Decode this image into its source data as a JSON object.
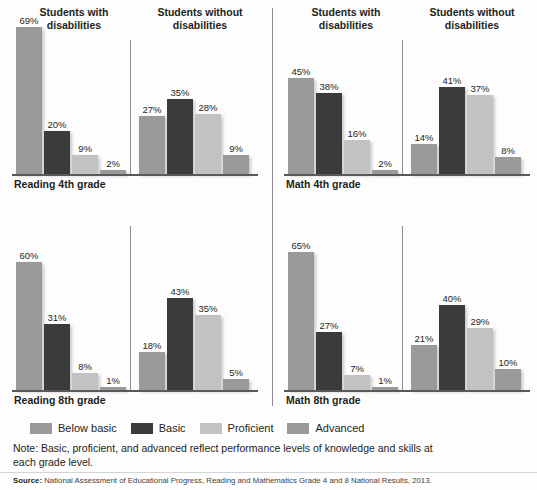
{
  "headers": {
    "with_disabilities": "Students with disabilities",
    "without_disabilities": "Students without disabilities"
  },
  "legend": {
    "items": [
      {
        "label": "Below basic",
        "color": "#9a9a9a",
        "key": "below"
      },
      {
        "label": "Basic",
        "color": "#3b3b3b",
        "key": "basic"
      },
      {
        "label": "Proficient",
        "color": "#c2c2c2",
        "key": "prof"
      },
      {
        "label": "Advanced",
        "color": "#9a9a9a",
        "key": "adv"
      }
    ]
  },
  "note": "Note: Basic, proficient, and advanced reflect performance levels of knowledge and skills at each grade level.",
  "source": {
    "label": "Source:",
    "text": "National Assessment of Educational Progress, Reading and Mathematics Grade 4 and 8 National Results, 2013."
  },
  "panels": [
    {
      "id": "reading-4th-grade",
      "title": "Reading 4th grade",
      "with": {
        "labels": [
          "69%",
          "20%",
          "9%",
          "2%"
        ],
        "values": [
          69,
          20,
          9,
          2
        ]
      },
      "without": {
        "labels": [
          "27%",
          "35%",
          "28%",
          "9%"
        ],
        "values": [
          27,
          35,
          28,
          9
        ]
      }
    },
    {
      "id": "math-4th-grade",
      "title": "Math 4th grade",
      "with": {
        "labels": [
          "45%",
          "38%",
          "16%",
          "2%"
        ],
        "values": [
          45,
          38,
          16,
          2
        ]
      },
      "without": {
        "labels": [
          "14%",
          "41%",
          "37%",
          "8%"
        ],
        "values": [
          14,
          41,
          37,
          8
        ]
      }
    },
    {
      "id": "reading-8th-grade",
      "title": "Reading 8th grade",
      "with": {
        "labels": [
          "60%",
          "31%",
          "8%",
          "1%"
        ],
        "values": [
          60,
          31,
          8,
          1
        ]
      },
      "without": {
        "labels": [
          "18%",
          "43%",
          "35%",
          "5%"
        ],
        "values": [
          18,
          43,
          35,
          5
        ]
      }
    },
    {
      "id": "math-8th-grade",
      "title": "Math 8th grade",
      "with": {
        "labels": [
          "65%",
          "27%",
          "7%",
          "1%"
        ],
        "values": [
          65,
          27,
          7,
          1
        ]
      },
      "without": {
        "labels": [
          "21%",
          "40%",
          "29%",
          "10%"
        ],
        "values": [
          21,
          40,
          29,
          10
        ]
      }
    }
  ],
  "chart_data": {
    "type": "bar",
    "title": "",
    "xlabel": "",
    "ylabel": "Percent of students",
    "ylim": [
      0,
      70
    ],
    "grid": false,
    "legend_position": "bottom",
    "categories": [
      "Below basic",
      "Basic",
      "Proficient",
      "Advanced"
    ],
    "panels": [
      {
        "panel": "Reading 4th grade",
        "groups": [
          {
            "name": "Students with disabilities",
            "values": [
              69,
              20,
              9,
              2
            ]
          },
          {
            "name": "Students without disabilities",
            "values": [
              27,
              35,
              28,
              9
            ]
          }
        ]
      },
      {
        "panel": "Math 4th grade",
        "groups": [
          {
            "name": "Students with disabilities",
            "values": [
              45,
              38,
              16,
              2
            ]
          },
          {
            "name": "Students without disabilities",
            "values": [
              14,
              41,
              37,
              8
            ]
          }
        ]
      },
      {
        "panel": "Reading 8th grade",
        "groups": [
          {
            "name": "Students with disabilities",
            "values": [
              60,
              31,
              8,
              1
            ]
          },
          {
            "name": "Students without disabilities",
            "values": [
              18,
              43,
              35,
              5
            ]
          }
        ]
      },
      {
        "panel": "Math 8th grade",
        "groups": [
          {
            "name": "Students with disabilities",
            "values": [
              65,
              27,
              7,
              1
            ]
          },
          {
            "name": "Students without disabilities",
            "values": [
              21,
              40,
              29,
              10
            ]
          }
        ]
      }
    ],
    "annotations": [
      "Note: Basic, proficient, and advanced reflect performance levels of knowledge and skills at each grade level."
    ]
  }
}
